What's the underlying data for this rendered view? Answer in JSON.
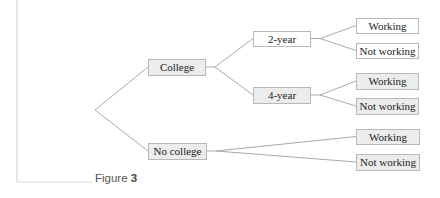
{
  "figure": {
    "caption_prefix": "Figure",
    "caption_number": "3"
  },
  "tree": {
    "root": {
      "children": [
        {
          "id": "college",
          "label": "College",
          "shaded": true,
          "children": [
            {
              "id": "two-year",
              "label": "2-year",
              "shaded": false,
              "children": [
                {
                  "id": "two-year-working",
                  "label": "Working",
                  "shaded": false
                },
                {
                  "id": "two-year-not-working",
                  "label": "Not working",
                  "shaded": false
                }
              ]
            },
            {
              "id": "four-year",
              "label": "4-year",
              "shaded": true,
              "children": [
                {
                  "id": "four-year-working",
                  "label": "Working",
                  "shaded": true
                },
                {
                  "id": "four-year-not-working",
                  "label": "Not working",
                  "shaded": true
                }
              ]
            }
          ]
        },
        {
          "id": "no-college",
          "label": "No college",
          "shaded": true,
          "children": [
            {
              "id": "no-college-working",
              "label": "Working",
              "shaded": true
            },
            {
              "id": "no-college-not-working",
              "label": "Not working",
              "shaded": true
            }
          ]
        }
      ]
    }
  }
}
